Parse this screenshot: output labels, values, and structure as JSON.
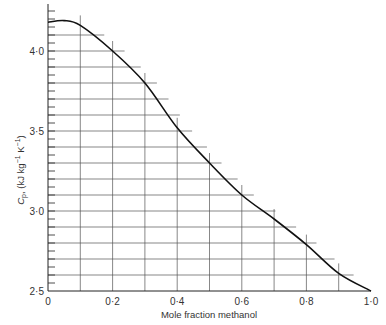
{
  "chart_data": {
    "type": "line",
    "title": "",
    "xlabel": "Mole fraction methanol",
    "ylabel": "Cp, (kJ kg⁻¹ K⁻¹)",
    "xlim": [
      0,
      1.0
    ],
    "ylim": [
      2.5,
      4.3
    ],
    "x_ticks": [
      0,
      0.2,
      0.4,
      0.6,
      0.8,
      1.0
    ],
    "x_tick_labels": [
      "0",
      "0·2",
      "0·4",
      "0·6",
      "0·8",
      "1·0"
    ],
    "y_ticks": [
      2.5,
      3.0,
      3.5,
      4.0
    ],
    "y_tick_labels": [
      "2·5",
      "3·0",
      "3·5",
      "4·0"
    ],
    "y_minor_tick_step": 0.05,
    "grid": "staircase (vertical lines every 0.1 up to curve, horizontal lines every 0.1 out to curve)",
    "legend": null,
    "series": [
      {
        "name": "Cp",
        "x": [
          0,
          0.05,
          0.1,
          0.2,
          0.3,
          0.4,
          0.5,
          0.6,
          0.7,
          0.8,
          0.9,
          1.0
        ],
        "values": [
          4.18,
          4.19,
          4.16,
          4.0,
          3.8,
          3.52,
          3.3,
          3.1,
          2.95,
          2.79,
          2.61,
          2.5
        ]
      }
    ]
  },
  "axis": {
    "x_title": "Mole fraction methanol",
    "y_title_main": "C",
    "y_title_sub": "p",
    "y_title_rest": ", (kJ kg",
    "y_title_exp1": "−1",
    "y_title_mid": " K",
    "y_title_exp2": "−1",
    "y_title_end": ")"
  },
  "colors": {
    "curve": "#111111",
    "grid": "#555555",
    "axis": "#222222",
    "background": "#ffffff"
  }
}
